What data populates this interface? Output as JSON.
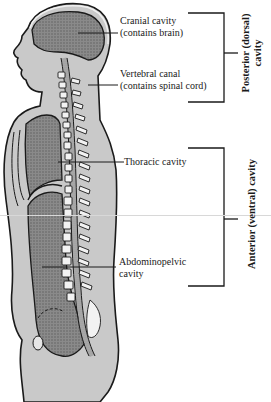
{
  "figure": {
    "colors": {
      "body_fill": "#c8c8c8",
      "cavity_fill": "#7a7a7a",
      "outline": "#1a1a1a",
      "vertebra": "#f2f2f2"
    }
  },
  "labels": {
    "cranial": {
      "line1": "Cranial cavity",
      "line2": "(contains brain)"
    },
    "vertebral": {
      "line1": "Vertebral canal",
      "line2": "(contains spinal cord)"
    },
    "thoracic": {
      "line1": "Thoracic cavity"
    },
    "abdominopelvic": {
      "line1": "Abdominopelvic",
      "line2": "cavity"
    }
  },
  "groups": {
    "posterior": {
      "line1": "Posterior (dorsal)",
      "line2": "cavity"
    },
    "anterior": {
      "line1": "Anterior (ventral) cavity"
    }
  }
}
